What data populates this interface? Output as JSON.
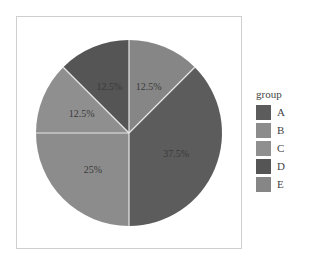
{
  "chart_data": {
    "type": "pie",
    "title": "",
    "legend": {
      "title": "group",
      "position": "right"
    },
    "categories": [
      "A",
      "B",
      "C",
      "D",
      "E"
    ],
    "values": [
      37.5,
      25,
      12.5,
      12.5,
      12.5
    ],
    "labels": [
      "37.5%",
      "25%",
      "12.5%",
      "12.5%",
      "12.5%"
    ],
    "colors": [
      "#5c5c5c",
      "#8c8c8c",
      "#8f8f8f",
      "#555555",
      "#868686"
    ],
    "slice_order_clockwise_from_top": [
      "E",
      "A",
      "B",
      "C",
      "D"
    ]
  },
  "legend": {
    "title": "group",
    "items": [
      {
        "label": "A",
        "color": "#5c5c5c"
      },
      {
        "label": "B",
        "color": "#8c8c8c"
      },
      {
        "label": "C",
        "color": "#8f8f8f"
      },
      {
        "label": "D",
        "color": "#555555"
      },
      {
        "label": "E",
        "color": "#868686"
      }
    ]
  }
}
